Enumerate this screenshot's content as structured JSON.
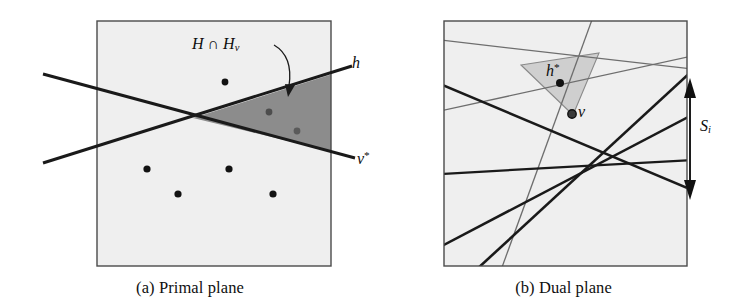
{
  "figure": {
    "panels": [
      {
        "id": "primal",
        "caption": "(a) Primal plane",
        "labels": {
          "region": "H ∩ H",
          "region_sub": "v",
          "line_h": "h",
          "line_v_dual": "v",
          "line_v_dual_sup": "*"
        },
        "colors": {
          "frame": "#4a4a4a",
          "background": "#efefef",
          "shaded_region": "#8c8c8c",
          "line": "#1a1a1a",
          "point": "#121212"
        },
        "points": [
          {
            "name": "p1",
            "x": 225,
            "y": 82,
            "shade": "dark"
          },
          {
            "name": "p2",
            "x": 269,
            "y": 112,
            "shade": "muted"
          },
          {
            "name": "p3",
            "x": 297,
            "y": 131,
            "shade": "muted"
          },
          {
            "name": "p4",
            "x": 147,
            "y": 169,
            "shade": "dark"
          },
          {
            "name": "p5",
            "x": 229,
            "y": 169,
            "shade": "dark"
          },
          {
            "name": "p6",
            "x": 178,
            "y": 194,
            "shade": "dark"
          },
          {
            "name": "p7",
            "x": 273,
            "y": 194,
            "shade": "dark"
          }
        ],
        "lines": [
          {
            "name": "line-h",
            "x1": 43,
            "y1": 163,
            "x2": 352,
            "y2": 66
          },
          {
            "name": "line-v*",
            "x1": 43,
            "y1": 74,
            "x2": 355,
            "y2": 158
          }
        ],
        "frame": {
          "x": 97,
          "y": 21,
          "width": 234,
          "height": 245
        }
      },
      {
        "id": "dual",
        "caption": "(b) Dual plane",
        "labels": {
          "point_h_dual": "h",
          "point_h_dual_sup": "*",
          "point_v": "v",
          "slab": "S",
          "slab_sub": "i"
        },
        "colors": {
          "frame": "#4a4a4a",
          "background": "#efefef",
          "triangle_fill": "#cfcfcf",
          "line_dark": "#1a1a1a",
          "line_light": "#6e6e6e",
          "point": "#121212",
          "arrow": "#101010"
        },
        "points": [
          {
            "name": "h-star-point",
            "x": 560,
            "y": 83,
            "shade": "dark"
          },
          {
            "name": "v-point",
            "x": 572,
            "y": 114,
            "shade": "ring"
          }
        ],
        "triangle": [
          {
            "x": 521,
            "y": 65
          },
          {
            "x": 599,
            "y": 53
          },
          {
            "x": 573,
            "y": 115
          }
        ],
        "lines": [
          {
            "name": "dual-line-1",
            "x1": 445,
            "y1": 41,
            "x2": 687,
            "y2": 69,
            "weight": "light"
          },
          {
            "name": "dual-line-2",
            "x1": 445,
            "y1": 110,
            "x2": 687,
            "y2": 57,
            "weight": "light"
          },
          {
            "name": "dual-line-3",
            "x1": 504,
            "y1": 266,
            "x2": 591,
            "y2": 21,
            "weight": "light"
          },
          {
            "name": "dual-line-4",
            "x1": 445,
            "y1": 86,
            "x2": 687,
            "y2": 188,
            "weight": "dark"
          },
          {
            "name": "dual-line-5",
            "x1": 445,
            "y1": 173,
            "x2": 687,
            "y2": 160,
            "weight": "dark"
          },
          {
            "name": "dual-line-6",
            "x1": 445,
            "y1": 245,
            "x2": 687,
            "y2": 117,
            "weight": "dark"
          },
          {
            "name": "dual-line-7",
            "x1": 479,
            "y1": 266,
            "x2": 687,
            "y2": 74,
            "weight": "dark"
          }
        ],
        "slab_arrow": {
          "x": 690,
          "y_top": 85,
          "y_bottom": 193
        },
        "frame": {
          "x": 444,
          "y": 21,
          "width": 243,
          "height": 245
        }
      }
    ]
  }
}
